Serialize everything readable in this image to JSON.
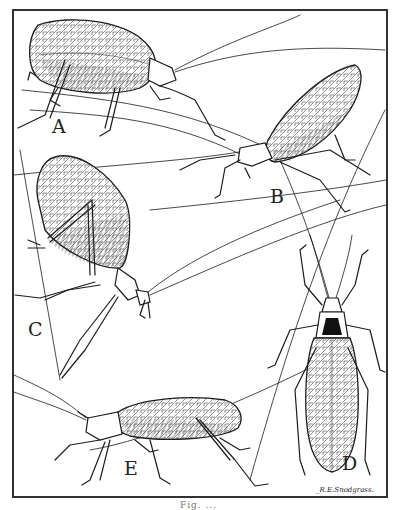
{
  "figure": {
    "panel_labels": {
      "A": "A",
      "B": "B",
      "C": "C",
      "D": "D",
      "E": "E"
    },
    "signature": "_R.E.Snodgrass.",
    "caption": "Fig. ..."
  },
  "colors": {
    "ink": "#1c1c1c",
    "paper": "#ffffff"
  }
}
